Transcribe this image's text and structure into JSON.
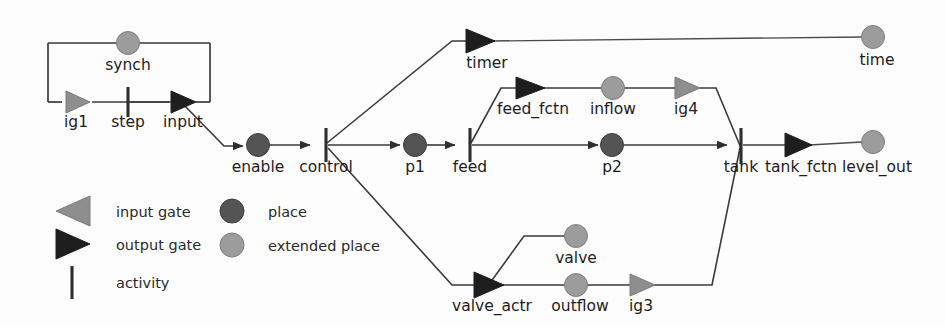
{
  "diagram": {
    "colors": {
      "place": "#545454",
      "extended_place": "#9c9c9c",
      "output_gate": "#1e1e1e",
      "input_gate": "#8e8e8e",
      "activity": "#2e2e2e",
      "edge": "#3a3a3a",
      "background": "#fdfdfd"
    },
    "nodes": [
      {
        "id": "synch",
        "label": "synch",
        "type": "extended-place",
        "x": 128,
        "y": 43,
        "label_x": 128,
        "label_y": 70,
        "label_anchor": "middle"
      },
      {
        "id": "ig1",
        "label": "ig1",
        "type": "input-gate",
        "x": 76,
        "y": 102,
        "label_x": 76,
        "label_y": 127,
        "label_anchor": "middle"
      },
      {
        "id": "step",
        "label": "step",
        "type": "activity",
        "x": 128,
        "y": 102,
        "label_x": 128,
        "label_y": 127,
        "label_anchor": "middle"
      },
      {
        "id": "input",
        "label": "input",
        "type": "output-gate",
        "x": 183,
        "y": 102,
        "label_x": 183,
        "label_y": 127,
        "label_anchor": "middle"
      },
      {
        "id": "enable",
        "label": "enable",
        "type": "place",
        "x": 258,
        "y": 145,
        "label_x": 258,
        "label_y": 172,
        "label_anchor": "middle"
      },
      {
        "id": "control",
        "label": "control",
        "type": "activity",
        "x": 326,
        "y": 145,
        "label_x": 326,
        "label_y": 172,
        "label_anchor": "middle"
      },
      {
        "id": "p1",
        "label": "p1",
        "type": "place",
        "x": 415,
        "y": 145,
        "label_x": 415,
        "label_y": 172,
        "label_anchor": "middle"
      },
      {
        "id": "feed",
        "label": "feed",
        "type": "activity",
        "x": 470,
        "y": 145,
        "label_x": 470,
        "label_y": 172,
        "label_anchor": "middle"
      },
      {
        "id": "p2",
        "label": "p2",
        "type": "place",
        "x": 612,
        "y": 145,
        "label_x": 612,
        "label_y": 172,
        "label_anchor": "middle"
      },
      {
        "id": "tank",
        "label": "tank",
        "type": "activity",
        "x": 741,
        "y": 145,
        "label_x": 741,
        "label_y": 172,
        "label_anchor": "middle"
      },
      {
        "id": "tank_fctn",
        "label": "tank_fctn",
        "type": "output-gate",
        "x": 795,
        "y": 145,
        "label_x": 801,
        "label_y": 172,
        "label_anchor": "middle"
      },
      {
        "id": "level_out",
        "label": "level_out",
        "type": "extended-place",
        "x": 873,
        "y": 142,
        "label_x": 877,
        "label_y": 172,
        "label_anchor": "middle"
      },
      {
        "id": "timer",
        "label": "timer",
        "type": "output-gate",
        "x": 478,
        "y": 41,
        "label_x": 487,
        "label_y": 68,
        "label_anchor": "middle"
      },
      {
        "id": "time",
        "label": "time",
        "type": "extended-place",
        "x": 873,
        "y": 37,
        "label_x": 877,
        "label_y": 65,
        "label_anchor": "middle"
      },
      {
        "id": "feed_fctn",
        "label": "feed_fctn",
        "type": "output-gate",
        "x": 528,
        "y": 88,
        "label_x": 533,
        "label_y": 114,
        "label_anchor": "middle"
      },
      {
        "id": "inflow",
        "label": "inflow",
        "type": "extended-place",
        "x": 613,
        "y": 88,
        "label_x": 613,
        "label_y": 114,
        "label_anchor": "middle"
      },
      {
        "id": "ig4",
        "label": "ig4",
        "type": "input-gate",
        "x": 686,
        "y": 88,
        "label_x": 686,
        "label_y": 114,
        "label_anchor": "middle"
      },
      {
        "id": "valve_actr",
        "label": "valve_actr",
        "type": "output-gate",
        "x": 487,
        "y": 285,
        "label_x": 492,
        "label_y": 311,
        "label_anchor": "middle"
      },
      {
        "id": "valve",
        "label": "valve",
        "type": "extended-place",
        "x": 576,
        "y": 236,
        "label_x": 576,
        "label_y": 263,
        "label_anchor": "middle"
      },
      {
        "id": "outflow",
        "label": "outflow",
        "type": "extended-place",
        "x": 576,
        "y": 285,
        "label_x": 580,
        "label_y": 311,
        "label_anchor": "middle"
      },
      {
        "id": "ig3",
        "label": "ig3",
        "type": "input-gate",
        "x": 641,
        "y": 285,
        "label_x": 641,
        "label_y": 311,
        "label_anchor": "middle"
      }
    ],
    "edges": [
      {
        "from": "synch-box",
        "to": "ig1",
        "desc": "synch feedback box left side"
      },
      {
        "from": "synch-box",
        "to": "input",
        "desc": "synch feedback box right side"
      },
      {
        "from": "ig1",
        "to": "step",
        "desc": "input gate into step activity"
      },
      {
        "from": "step",
        "to": "input",
        "desc": "step activity to output gate input"
      },
      {
        "from": "input",
        "to": "enable",
        "desc": "diagonal drop to enable place"
      },
      {
        "from": "enable",
        "to": "control",
        "desc": "enable place to control activity"
      },
      {
        "from": "control",
        "to": "timer",
        "desc": "control up-diagonal to timer output gate"
      },
      {
        "from": "control",
        "to": "p1",
        "desc": "control to p1 place"
      },
      {
        "from": "control",
        "to": "valve_actr",
        "desc": "control down-diagonal to valve actuator"
      },
      {
        "from": "timer",
        "to": "time",
        "desc": "timer output gate to time extended place"
      },
      {
        "from": "p1",
        "to": "feed",
        "desc": "p1 to feed activity"
      },
      {
        "from": "feed",
        "to": "feed_fctn",
        "desc": "feed activity up to feed_fctn output gate"
      },
      {
        "from": "feed",
        "to": "p2",
        "desc": "feed activity to p2 place"
      },
      {
        "from": "feed_fctn",
        "to": "inflow",
        "desc": "feed_fctn to inflow extended place"
      },
      {
        "from": "inflow",
        "to": "ig4",
        "desc": "inflow to ig4 input gate"
      },
      {
        "from": "ig4",
        "to": "tank",
        "desc": "ig4 down-diagonal to tank activity"
      },
      {
        "from": "p2",
        "to": "tank",
        "desc": "p2 to tank activity"
      },
      {
        "from": "tank",
        "to": "tank_fctn",
        "desc": "tank activity to tank_fctn output gate"
      },
      {
        "from": "tank_fctn",
        "to": "level_out",
        "desc": "tank_fctn to level_out extended place"
      },
      {
        "from": "valve_actr",
        "to": "valve",
        "desc": "valve actuator up to valve extended place"
      },
      {
        "from": "valve_actr",
        "to": "outflow",
        "desc": "valve actuator to outflow extended place"
      },
      {
        "from": "outflow",
        "to": "ig3",
        "desc": "outflow to ig3 input gate"
      },
      {
        "from": "ig3",
        "to": "tank",
        "desc": "ig3 up-diagonal to tank activity"
      }
    ]
  },
  "legend": {
    "items": [
      {
        "id": "input-gate",
        "label": "input gate",
        "symbol": "left-triangle",
        "x": 72,
        "y": 211
      },
      {
        "id": "output-gate",
        "label": "output gate",
        "symbol": "right-triangle",
        "x": 72,
        "y": 243
      },
      {
        "id": "activity",
        "label": "activity",
        "symbol": "vertical-bar",
        "x": 72,
        "y": 280
      },
      {
        "id": "place",
        "label": "place",
        "symbol": "dark-circle",
        "x": 224,
        "y": 211
      },
      {
        "id": "extended-place",
        "label": "extended place",
        "symbol": "light-circle",
        "x": 224,
        "y": 245
      }
    ],
    "label_offsets": {
      "left": 116,
      "right": 268
    }
  }
}
